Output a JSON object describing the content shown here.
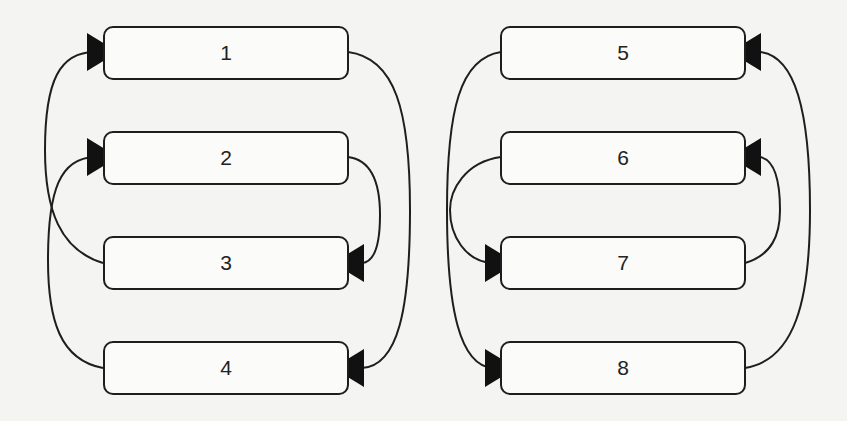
{
  "diagram": {
    "type": "directed-graph",
    "background": "#f4f4f2",
    "stroke_color": "#1e1e1e",
    "groups": [
      {
        "name": "left-group",
        "nodes": [
          {
            "id": "n1",
            "label": "1"
          },
          {
            "id": "n2",
            "label": "2"
          },
          {
            "id": "n3",
            "label": "3"
          },
          {
            "id": "n4",
            "label": "4"
          }
        ]
      },
      {
        "name": "right-group",
        "nodes": [
          {
            "id": "n5",
            "label": "5"
          },
          {
            "id": "n6",
            "label": "6"
          },
          {
            "id": "n7",
            "label": "7"
          },
          {
            "id": "n8",
            "label": "8"
          }
        ]
      }
    ],
    "edges": [
      {
        "from": "3",
        "to": "1",
        "side": "left"
      },
      {
        "from": "4",
        "to": "2",
        "side": "left"
      },
      {
        "from": "1",
        "to": "4",
        "side": "right"
      },
      {
        "from": "2",
        "to": "3",
        "side": "right"
      },
      {
        "from": "5",
        "to": "8",
        "side": "left"
      },
      {
        "from": "6",
        "to": "7",
        "side": "left"
      },
      {
        "from": "8",
        "to": "5",
        "side": "right"
      },
      {
        "from": "7",
        "to": "6",
        "side": "right"
      }
    ]
  }
}
